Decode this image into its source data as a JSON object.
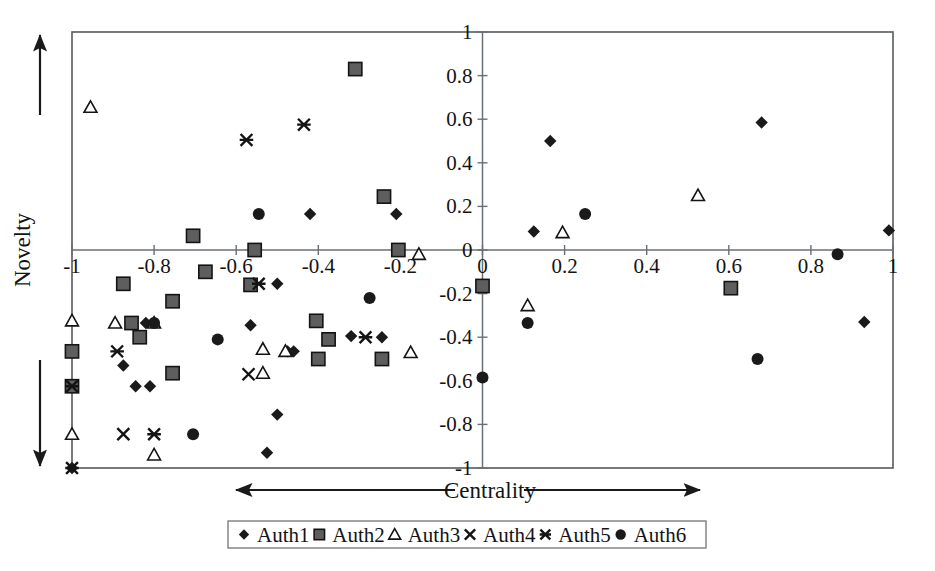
{
  "chart_data": {
    "type": "scatter",
    "title": "",
    "xlabel": "Centrality",
    "ylabel": "Novelty",
    "xlim": [
      -1,
      1
    ],
    "ylim": [
      -1,
      1
    ],
    "grid": false,
    "legend_position": "bottom",
    "x_ticks": [
      "-1",
      "-0.8",
      "-0.6",
      "-0.4",
      "-0.2",
      "0",
      "0.2",
      "0.4",
      "0.6",
      "0.8",
      "1"
    ],
    "y_ticks": [
      "1",
      "0.8",
      "0.6",
      "0.4",
      "0.2",
      "0",
      "-0.2",
      "-0.4",
      "-0.6",
      "-0.8",
      "-1"
    ],
    "x_tick_values": [
      -1,
      -0.8,
      -0.6,
      -0.4,
      -0.2,
      0,
      0.2,
      0.4,
      0.6,
      0.8,
      1
    ],
    "y_tick_values": [
      1,
      0.8,
      0.6,
      0.4,
      0.2,
      0,
      -0.2,
      -0.4,
      -0.6,
      -0.8,
      -1
    ],
    "axis_arrows": {
      "x_left_arrow": true,
      "x_right_arrow": true,
      "y_up_arrow": true,
      "y_down_arrow": true
    },
    "series": [
      {
        "name": "Auth1",
        "marker": "diamond-filled",
        "color": "#1a1a1a",
        "points": [
          [
            -0.42,
            0.165
          ],
          [
            -0.21,
            0.165
          ],
          [
            0.125,
            0.085
          ],
          [
            0.165,
            0.5
          ],
          [
            0.68,
            0.585
          ],
          [
            0.99,
            0.09
          ],
          [
            -0.5,
            -0.155
          ],
          [
            -0.855,
            -0.335
          ],
          [
            -0.82,
            -0.335
          ],
          [
            -0.565,
            -0.345
          ],
          [
            -0.32,
            -0.395
          ],
          [
            -0.245,
            -0.4
          ],
          [
            -0.875,
            -0.53
          ],
          [
            -0.845,
            -0.625
          ],
          [
            -0.81,
            -0.625
          ],
          [
            -0.475,
            -0.465
          ],
          [
            -0.46,
            -0.465
          ],
          [
            -0.5,
            -0.755
          ],
          [
            -0.525,
            -0.93
          ],
          [
            -1.0,
            -1.0
          ],
          [
            0.93,
            -0.33
          ]
        ]
      },
      {
        "name": "Auth2",
        "marker": "square-filled",
        "color": "#5e5e5e",
        "points": [
          [
            -0.31,
            0.83
          ],
          [
            -0.705,
            0.065
          ],
          [
            -0.24,
            0.245
          ],
          [
            -0.555,
            0.0
          ],
          [
            -0.205,
            0.0
          ],
          [
            -0.675,
            -0.1
          ],
          [
            -0.875,
            -0.155
          ],
          [
            -0.565,
            -0.16
          ],
          [
            -0.755,
            -0.235
          ],
          [
            -0.855,
            -0.335
          ],
          [
            -0.835,
            -0.4
          ],
          [
            -1.0,
            -0.465
          ],
          [
            -0.755,
            -0.565
          ],
          [
            -0.405,
            -0.325
          ],
          [
            -0.375,
            -0.41
          ],
          [
            -0.245,
            -0.5
          ],
          [
            -0.4,
            -0.5
          ],
          [
            -1.0,
            -0.625
          ],
          [
            0.0,
            -0.165
          ],
          [
            0.605,
            -0.175
          ]
        ]
      },
      {
        "name": "Auth3",
        "marker": "triangle-open",
        "color": "#141414",
        "points": [
          [
            -0.955,
            0.655
          ],
          [
            -0.155,
            -0.02
          ],
          [
            -1.0,
            -0.325
          ],
          [
            -0.895,
            -0.335
          ],
          [
            -0.8,
            -0.335
          ],
          [
            -0.535,
            -0.455
          ],
          [
            -0.175,
            -0.47
          ],
          [
            -0.48,
            -0.465
          ],
          [
            -0.535,
            -0.565
          ],
          [
            -1.0,
            -0.845
          ],
          [
            -0.8,
            -0.94
          ],
          [
            0.195,
            0.08
          ],
          [
            0.525,
            0.25
          ],
          [
            0.11,
            -0.255
          ]
        ]
      },
      {
        "name": "Auth4",
        "marker": "x-cross",
        "color": "#141414",
        "points": [
          [
            -0.875,
            -0.845
          ],
          [
            -0.57,
            -0.57
          ]
        ]
      },
      {
        "name": "Auth5",
        "marker": "asterisk",
        "color": "#141414",
        "points": [
          [
            -0.575,
            0.505
          ],
          [
            -0.435,
            0.575
          ],
          [
            -0.545,
            -0.155
          ],
          [
            -0.89,
            -0.465
          ],
          [
            -0.285,
            -0.4
          ],
          [
            -1.0,
            -0.625
          ],
          [
            -0.8,
            -0.845
          ],
          [
            -1.0,
            -1.0
          ]
        ]
      },
      {
        "name": "Auth6",
        "marker": "circle-filled",
        "color": "#1a1a1a",
        "points": [
          [
            -0.545,
            0.165
          ],
          [
            -0.8,
            -0.335
          ],
          [
            -0.645,
            -0.41
          ],
          [
            -0.275,
            -0.22
          ],
          [
            -0.705,
            -0.845
          ],
          [
            0.25,
            0.165
          ],
          [
            0.865,
            -0.02
          ],
          [
            0.11,
            -0.335
          ],
          [
            0.0,
            -0.585
          ],
          [
            0.67,
            -0.5
          ]
        ]
      }
    ]
  },
  "legend": {
    "items": [
      {
        "label": "Auth1",
        "marker": "diamond-filled"
      },
      {
        "label": "Auth2",
        "marker": "square-filled"
      },
      {
        "label": "Auth3",
        "marker": "triangle-open"
      },
      {
        "label": "Auth4",
        "marker": "x-cross"
      },
      {
        "label": "Auth5",
        "marker": "asterisk"
      },
      {
        "label": "Auth6",
        "marker": "circle-filled"
      }
    ]
  },
  "axes": {
    "x_title": "Centrality",
    "y_title": "Novelty"
  },
  "icons": {
    "x_left_arrow": "arrow-left-icon",
    "x_right_arrow": "arrow-right-icon",
    "y_up_arrow": "arrow-up-icon",
    "y_down_arrow": "arrow-down-icon"
  }
}
